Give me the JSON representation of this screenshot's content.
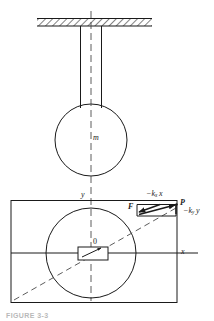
{
  "figure": {
    "caption": "FIGURE 3-3",
    "upper_view": {
      "name": "side-elevation-pendulum",
      "ceiling_hatch": "hatched-support-ceiling",
      "rod": "vertical-rod",
      "bob_label": "m",
      "centerline": "vertical-dashed-centerline"
    },
    "lower_view": {
      "name": "plan-view-force-diagram",
      "axis_y_label": "y",
      "axis_x_label": "x",
      "origin_label": "0",
      "point_label": "P",
      "force_label": "F",
      "force_x_component": "−k",
      "force_x_component_sub": "x",
      "force_x_component_tail": "x",
      "force_y_component": "−k",
      "force_y_component_sub": "y",
      "force_y_component_tail": "y",
      "boundary": "outer-rectangle",
      "swept_circle": "dashed-path-circle",
      "origin_box": "small-origin-rectangle",
      "diagonal": "dashed-diagonal-line"
    },
    "colors": {
      "stroke": "#1a1a1a",
      "dashed": "#4a4a4a",
      "background": "#ffffff",
      "caption": "#b9b9b9"
    }
  }
}
